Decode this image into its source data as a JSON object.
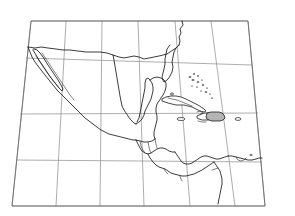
{
  "map": {
    "title": "Middle America and the Caribbean outline map",
    "projection": "conic",
    "background_color": "#ffffff",
    "coastline_color": "#1a1a1a",
    "graticule_color": "#8a8a8a",
    "highlight_color": "#b4b4b4",
    "frame": {
      "top_left": [
        31,
        21
      ],
      "top_right": [
        248,
        21
      ],
      "bottom_left": [
        12,
        206
      ],
      "bottom_right": [
        265,
        206
      ]
    },
    "graticule": {
      "meridian_count": 7,
      "parallel_count": 5,
      "meridians_top_x": [
        31,
        66,
        102,
        138,
        175,
        211,
        248
      ],
      "meridians_bottom_x": [
        12,
        56,
        100,
        144,
        190,
        235,
        265
      ],
      "parallels_left_y": [
        21,
        58,
        114,
        160,
        206
      ],
      "parallels_right_y": [
        21,
        65,
        113,
        162,
        206
      ],
      "labels_visible": false
    },
    "features": [
      {
        "name": "mexico",
        "kind": "mainland",
        "highlighted": false
      },
      {
        "name": "baja-california",
        "kind": "peninsula",
        "highlighted": false
      },
      {
        "name": "yucatan-peninsula",
        "kind": "peninsula",
        "highlighted": false
      },
      {
        "name": "united-states-gulf-coast",
        "kind": "mainland",
        "highlighted": false
      },
      {
        "name": "florida-peninsula",
        "kind": "peninsula",
        "highlighted": false
      },
      {
        "name": "guatemala-belize-honduras",
        "kind": "mainland",
        "highlighted": false
      },
      {
        "name": "nicaragua-costa-rica-panama",
        "kind": "mainland",
        "highlighted": false
      },
      {
        "name": "colombia-venezuela",
        "kind": "mainland",
        "highlighted": false
      },
      {
        "name": "cuba",
        "kind": "island",
        "highlighted": false
      },
      {
        "name": "hispaniola",
        "kind": "island",
        "highlighted": true
      },
      {
        "name": "jamaica",
        "kind": "island",
        "highlighted": false
      },
      {
        "name": "puerto-rico",
        "kind": "island",
        "highlighted": false
      },
      {
        "name": "bahamas",
        "kind": "archipelago",
        "highlighted": false
      },
      {
        "name": "lesser-antilles",
        "kind": "archipelago",
        "highlighted": false
      }
    ],
    "legend": {
      "present": false
    },
    "scale_bar": {
      "present": false
    },
    "north_arrow": {
      "present": false
    }
  }
}
